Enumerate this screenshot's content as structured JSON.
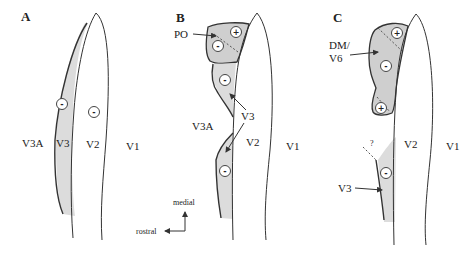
{
  "figure": {
    "panels": [
      {
        "id": "A",
        "label": "A",
        "areas": [
          "V3A",
          "V3",
          "V2",
          "V1"
        ],
        "signs": [
          "-",
          "-"
        ]
      },
      {
        "id": "B",
        "label": "B",
        "areas": [
          "PO",
          "V3A",
          "V3",
          "V2",
          "V1"
        ],
        "signs": [
          "+",
          "-",
          "-",
          "-"
        ]
      },
      {
        "id": "C",
        "label": "C",
        "areas": [
          "DM/",
          "V6",
          "?",
          "V3",
          "V2",
          "V1"
        ],
        "signs": [
          "+",
          "-",
          "+",
          "-"
        ]
      }
    ],
    "orientation": {
      "up_label": "medial",
      "left_label": "rostral"
    }
  }
}
